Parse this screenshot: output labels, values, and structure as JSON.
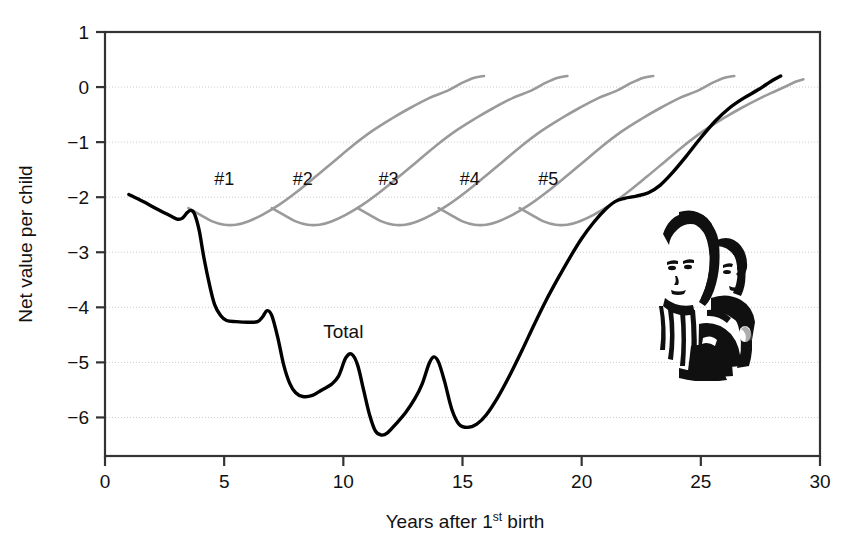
{
  "chart_data": {
    "type": "line",
    "title": "",
    "xlabel": "Years after 1st birth",
    "xlabel_main": "Years after 1",
    "xlabel_sup": "st",
    "xlabel_tail": " birth",
    "ylabel": "Net value per child",
    "xlim": [
      0,
      30
    ],
    "ylim": [
      -6.7,
      1
    ],
    "xticks": [
      0,
      5,
      10,
      15,
      20,
      25,
      30
    ],
    "xtick_labels": [
      "0",
      "5",
      "10",
      "15",
      "20",
      "25",
      "30"
    ],
    "yticks": [
      1,
      0,
      -1,
      -2,
      -3,
      -4,
      -5,
      -6
    ],
    "ytick_labels": [
      "1",
      "0",
      "−1",
      "−2",
      "−3",
      "−4",
      "−5",
      "−6"
    ],
    "grid": true,
    "grid_axis": "y",
    "legend_position": "inline-annotations",
    "colors": {
      "total": "#000000",
      "child": "#9a9a9a",
      "grid": "#cccccc",
      "axis": "#333333",
      "text": "#111111"
    },
    "annotations": [
      {
        "name": "child-1-label",
        "text": "#1",
        "x": 5.0,
        "y": -1.77
      },
      {
        "name": "child-2-label",
        "text": "#2",
        "x": 8.3,
        "y": -1.77
      },
      {
        "name": "child-3-label",
        "text": "#3",
        "x": 11.9,
        "y": -1.77
      },
      {
        "name": "child-4-label",
        "text": "#4",
        "x": 15.3,
        "y": -1.77
      },
      {
        "name": "child-5-label",
        "text": "#5",
        "x": 18.6,
        "y": -1.77
      },
      {
        "name": "total-label",
        "text": "Total",
        "x": 10.0,
        "y": -4.56
      }
    ],
    "series": [
      {
        "name": "Total",
        "color": "#000000",
        "width": 3.4,
        "points": [
          [
            1.0,
            -1.95
          ],
          [
            1.6,
            -2.08
          ],
          [
            2.2,
            -2.22
          ],
          [
            2.8,
            -2.35
          ],
          [
            3.05,
            -2.4
          ],
          [
            3.25,
            -2.38
          ],
          [
            3.45,
            -2.28
          ],
          [
            3.6,
            -2.24
          ],
          [
            3.75,
            -2.3
          ],
          [
            3.95,
            -2.6
          ],
          [
            4.15,
            -3.1
          ],
          [
            4.4,
            -3.62
          ],
          [
            4.6,
            -3.95
          ],
          [
            4.85,
            -4.15
          ],
          [
            5.1,
            -4.24
          ],
          [
            5.5,
            -4.26
          ],
          [
            6.0,
            -4.27
          ],
          [
            6.4,
            -4.26
          ],
          [
            6.6,
            -4.18
          ],
          [
            6.8,
            -4.06
          ],
          [
            7.0,
            -4.15
          ],
          [
            7.25,
            -4.55
          ],
          [
            7.5,
            -5.05
          ],
          [
            7.75,
            -5.38
          ],
          [
            8.0,
            -5.55
          ],
          [
            8.3,
            -5.62
          ],
          [
            8.7,
            -5.6
          ],
          [
            9.1,
            -5.5
          ],
          [
            9.5,
            -5.4
          ],
          [
            9.8,
            -5.25
          ],
          [
            10.1,
            -4.92
          ],
          [
            10.35,
            -4.85
          ],
          [
            10.6,
            -5.05
          ],
          [
            10.85,
            -5.5
          ],
          [
            11.1,
            -5.95
          ],
          [
            11.35,
            -6.25
          ],
          [
            11.6,
            -6.32
          ],
          [
            11.85,
            -6.28
          ],
          [
            12.2,
            -6.12
          ],
          [
            12.6,
            -5.92
          ],
          [
            13.0,
            -5.66
          ],
          [
            13.3,
            -5.4
          ],
          [
            13.6,
            -5.02
          ],
          [
            13.8,
            -4.9
          ],
          [
            14.0,
            -5.0
          ],
          [
            14.25,
            -5.35
          ],
          [
            14.55,
            -5.85
          ],
          [
            14.85,
            -6.12
          ],
          [
            15.2,
            -6.18
          ],
          [
            15.6,
            -6.12
          ],
          [
            16.0,
            -5.95
          ],
          [
            16.5,
            -5.62
          ],
          [
            17.0,
            -5.22
          ],
          [
            17.5,
            -4.78
          ],
          [
            18.0,
            -4.32
          ],
          [
            18.5,
            -3.88
          ],
          [
            19.0,
            -3.48
          ],
          [
            19.5,
            -3.1
          ],
          [
            20.0,
            -2.75
          ],
          [
            20.5,
            -2.46
          ],
          [
            21.0,
            -2.22
          ],
          [
            21.4,
            -2.08
          ],
          [
            21.8,
            -2.02
          ],
          [
            22.3,
            -1.98
          ],
          [
            22.8,
            -1.92
          ],
          [
            23.3,
            -1.78
          ],
          [
            23.8,
            -1.56
          ],
          [
            24.4,
            -1.25
          ],
          [
            25.0,
            -0.92
          ],
          [
            25.6,
            -0.62
          ],
          [
            26.2,
            -0.38
          ],
          [
            26.8,
            -0.2
          ],
          [
            27.4,
            -0.05
          ],
          [
            28.0,
            0.12
          ],
          [
            28.35,
            0.2
          ]
        ]
      },
      {
        "name": "#1",
        "color": "#9a9a9a",
        "width": 2.6,
        "points": [
          [
            3.5,
            -2.2
          ],
          [
            4.0,
            -2.32
          ],
          [
            4.5,
            -2.44
          ],
          [
            5.0,
            -2.5
          ],
          [
            5.5,
            -2.5
          ],
          [
            6.0,
            -2.44
          ],
          [
            6.6,
            -2.32
          ],
          [
            7.3,
            -2.14
          ],
          [
            8.0,
            -1.92
          ],
          [
            8.8,
            -1.64
          ],
          [
            9.6,
            -1.35
          ],
          [
            10.4,
            -1.06
          ],
          [
            11.2,
            -0.8
          ],
          [
            12.0,
            -0.58
          ],
          [
            12.8,
            -0.38
          ],
          [
            13.6,
            -0.2
          ],
          [
            14.4,
            -0.06
          ],
          [
            15.0,
            0.08
          ],
          [
            15.5,
            0.17
          ],
          [
            15.9,
            0.2
          ]
        ]
      },
      {
        "name": "#2",
        "color": "#9a9a9a",
        "width": 2.6,
        "points": [
          [
            7.0,
            -2.2
          ],
          [
            7.5,
            -2.32
          ],
          [
            8.0,
            -2.44
          ],
          [
            8.5,
            -2.5
          ],
          [
            9.0,
            -2.5
          ],
          [
            9.5,
            -2.44
          ],
          [
            10.1,
            -2.32
          ],
          [
            10.8,
            -2.14
          ],
          [
            11.5,
            -1.92
          ],
          [
            12.3,
            -1.64
          ],
          [
            13.1,
            -1.35
          ],
          [
            13.9,
            -1.06
          ],
          [
            14.7,
            -0.8
          ],
          [
            15.5,
            -0.58
          ],
          [
            16.3,
            -0.38
          ],
          [
            17.1,
            -0.2
          ],
          [
            17.9,
            -0.06
          ],
          [
            18.5,
            0.08
          ],
          [
            19.0,
            0.17
          ],
          [
            19.4,
            0.2
          ]
        ]
      },
      {
        "name": "#3",
        "color": "#9a9a9a",
        "width": 2.6,
        "points": [
          [
            10.6,
            -2.2
          ],
          [
            11.1,
            -2.32
          ],
          [
            11.6,
            -2.44
          ],
          [
            12.1,
            -2.5
          ],
          [
            12.6,
            -2.5
          ],
          [
            13.1,
            -2.44
          ],
          [
            13.7,
            -2.32
          ],
          [
            14.4,
            -2.14
          ],
          [
            15.1,
            -1.92
          ],
          [
            15.9,
            -1.64
          ],
          [
            16.7,
            -1.35
          ],
          [
            17.5,
            -1.06
          ],
          [
            18.3,
            -0.8
          ],
          [
            19.1,
            -0.58
          ],
          [
            19.9,
            -0.38
          ],
          [
            20.7,
            -0.2
          ],
          [
            21.5,
            -0.06
          ],
          [
            22.1,
            0.08
          ],
          [
            22.6,
            0.17
          ],
          [
            23.0,
            0.2
          ]
        ]
      },
      {
        "name": "#4",
        "color": "#9a9a9a",
        "width": 2.6,
        "points": [
          [
            14.0,
            -2.2
          ],
          [
            14.5,
            -2.32
          ],
          [
            15.0,
            -2.44
          ],
          [
            15.5,
            -2.5
          ],
          [
            16.0,
            -2.5
          ],
          [
            16.5,
            -2.44
          ],
          [
            17.1,
            -2.32
          ],
          [
            17.8,
            -2.14
          ],
          [
            18.5,
            -1.92
          ],
          [
            19.3,
            -1.64
          ],
          [
            20.1,
            -1.35
          ],
          [
            20.9,
            -1.06
          ],
          [
            21.7,
            -0.8
          ],
          [
            22.5,
            -0.58
          ],
          [
            23.3,
            -0.38
          ],
          [
            24.1,
            -0.2
          ],
          [
            24.9,
            -0.06
          ],
          [
            25.5,
            0.08
          ],
          [
            26.0,
            0.17
          ],
          [
            26.4,
            0.2
          ]
        ]
      },
      {
        "name": "#5",
        "color": "#9a9a9a",
        "width": 2.6,
        "points": [
          [
            17.4,
            -2.2
          ],
          [
            17.9,
            -2.32
          ],
          [
            18.4,
            -2.44
          ],
          [
            18.9,
            -2.5
          ],
          [
            19.4,
            -2.5
          ],
          [
            19.9,
            -2.44
          ],
          [
            20.5,
            -2.32
          ],
          [
            21.2,
            -2.14
          ],
          [
            21.9,
            -1.92
          ],
          [
            22.7,
            -1.64
          ],
          [
            23.5,
            -1.35
          ],
          [
            24.3,
            -1.06
          ],
          [
            25.1,
            -0.8
          ],
          [
            25.9,
            -0.58
          ],
          [
            26.7,
            -0.38
          ],
          [
            27.5,
            -0.2
          ],
          [
            28.1,
            -0.08
          ],
          [
            28.6,
            0.02
          ],
          [
            29.0,
            0.1
          ],
          [
            29.3,
            0.14
          ]
        ]
      }
    ],
    "image_inset": {
      "name": "family-photo",
      "description": "black-and-white photograph of a woman carrying a child"
    }
  }
}
